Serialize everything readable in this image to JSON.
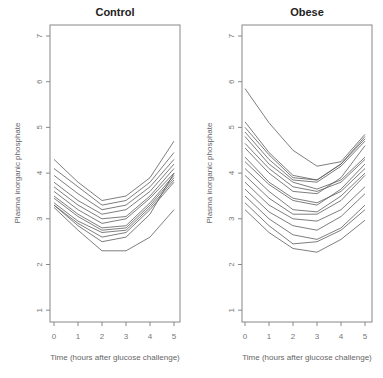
{
  "chart_data": [
    {
      "type": "line",
      "title": "Control",
      "xlabel": "Time (hours after glucose challenge)",
      "ylabel": "Plasma inorganic phosphate",
      "x": [
        0,
        1,
        2,
        3,
        4,
        5
      ],
      "xticks": [
        "0",
        "1",
        "2",
        "3",
        "4",
        "5"
      ],
      "yticks": [
        "1",
        "2",
        "3",
        "4",
        "5",
        "6",
        "7"
      ],
      "ylim": [
        0.8,
        7.2
      ],
      "xlim": [
        -0.2,
        5.2
      ],
      "grid": false,
      "series": [
        {
          "name": "subject 1",
          "values": [
            4.3,
            3.8,
            3.4,
            3.5,
            3.9,
            4.7
          ]
        },
        {
          "name": "subject 2",
          "values": [
            4.1,
            3.7,
            3.3,
            3.4,
            3.8,
            4.45
          ]
        },
        {
          "name": "subject 3",
          "values": [
            3.95,
            3.55,
            3.2,
            3.3,
            3.7,
            4.3
          ]
        },
        {
          "name": "subject 4",
          "values": [
            3.8,
            3.4,
            3.1,
            3.2,
            3.6,
            4.2
          ]
        },
        {
          "name": "subject 5",
          "values": [
            3.7,
            3.3,
            3.0,
            3.05,
            3.5,
            4.1
          ]
        },
        {
          "name": "subject 6",
          "values": [
            3.6,
            3.2,
            2.9,
            3.0,
            3.45,
            4.0
          ]
        },
        {
          "name": "subject 7",
          "values": [
            3.5,
            3.1,
            2.8,
            2.85,
            3.35,
            3.95
          ]
        },
        {
          "name": "subject 8",
          "values": [
            3.45,
            3.05,
            2.75,
            2.8,
            3.3,
            3.9
          ]
        },
        {
          "name": "subject 9",
          "values": [
            3.35,
            2.95,
            2.7,
            2.75,
            3.25,
            3.85
          ]
        },
        {
          "name": "subject 10",
          "values": [
            3.3,
            2.9,
            2.6,
            2.7,
            3.2,
            3.8
          ]
        },
        {
          "name": "subject 11",
          "values": [
            3.3,
            2.85,
            2.5,
            2.6,
            3.1,
            4.0
          ]
        },
        {
          "name": "subject 12",
          "values": [
            3.25,
            2.75,
            2.3,
            2.3,
            2.6,
            3.2
          ]
        }
      ]
    },
    {
      "type": "line",
      "title": "Obese",
      "xlabel": "Time (hours after glucose challenge)",
      "ylabel": "Plasma inorganic phosphate",
      "x": [
        0,
        1,
        2,
        3,
        4,
        5
      ],
      "xticks": [
        "0",
        "1",
        "2",
        "3",
        "4",
        "5"
      ],
      "yticks": [
        "1",
        "2",
        "3",
        "4",
        "5",
        "6",
        "7"
      ],
      "ylim": [
        0.8,
        7.2
      ],
      "xlim": [
        -0.2,
        5.2
      ],
      "grid": false,
      "series": [
        {
          "name": "subject 1",
          "values": [
            5.85,
            5.1,
            4.5,
            4.15,
            4.25,
            4.85
          ]
        },
        {
          "name": "subject 2",
          "values": [
            5.12,
            4.45,
            3.95,
            3.85,
            4.2,
            4.8
          ]
        },
        {
          "name": "subject 3",
          "values": [
            5.0,
            4.4,
            3.9,
            3.85,
            4.2,
            4.75
          ]
        },
        {
          "name": "subject 4",
          "values": [
            4.9,
            4.3,
            3.85,
            3.8,
            4.15,
            4.7
          ]
        },
        {
          "name": "subject 5",
          "values": [
            4.8,
            4.2,
            3.8,
            3.65,
            3.85,
            4.35
          ]
        },
        {
          "name": "subject 6",
          "values": [
            4.65,
            4.1,
            3.7,
            3.6,
            3.8,
            4.3
          ]
        },
        {
          "name": "subject 7",
          "values": [
            4.55,
            4.0,
            3.6,
            3.55,
            3.9,
            4.6
          ]
        },
        {
          "name": "subject 8",
          "values": [
            4.35,
            3.8,
            3.45,
            3.35,
            3.6,
            4.1
          ]
        },
        {
          "name": "subject 9",
          "values": [
            4.25,
            3.75,
            3.4,
            3.3,
            3.65,
            4.2
          ]
        },
        {
          "name": "subject 10",
          "values": [
            4.1,
            3.6,
            3.2,
            3.15,
            3.5,
            4.0
          ]
        },
        {
          "name": "subject 11",
          "values": [
            3.95,
            3.45,
            3.1,
            3.1,
            3.4,
            3.95
          ]
        },
        {
          "name": "subject 12",
          "values": [
            3.8,
            3.3,
            3.0,
            2.95,
            3.2,
            3.7
          ]
        },
        {
          "name": "subject 13",
          "values": [
            3.65,
            3.15,
            2.85,
            2.75,
            3.05,
            3.55
          ]
        },
        {
          "name": "subject 14",
          "values": [
            3.5,
            3.0,
            2.65,
            2.55,
            2.8,
            3.3
          ]
        },
        {
          "name": "subject 15",
          "values": [
            3.35,
            2.85,
            2.45,
            2.5,
            2.75,
            3.2
          ]
        },
        {
          "name": "subject 16",
          "values": [
            3.2,
            2.7,
            2.35,
            2.27,
            2.55,
            2.97
          ]
        }
      ]
    }
  ]
}
